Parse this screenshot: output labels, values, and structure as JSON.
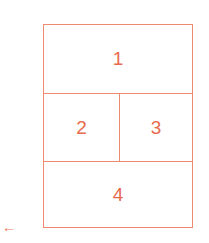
{
  "diagram": {
    "color": "#ee8a70",
    "cells": [
      {
        "label": "1"
      },
      {
        "label": "2"
      },
      {
        "label": "3"
      },
      {
        "label": "4"
      }
    ],
    "arrow": "←"
  }
}
